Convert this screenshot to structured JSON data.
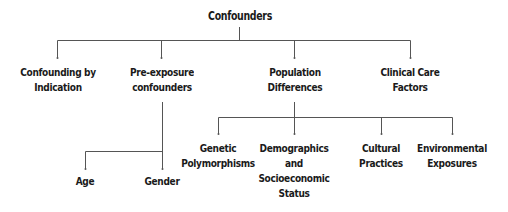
{
  "diagram": {
    "type": "tree",
    "root": {
      "label": "Confounders",
      "children": [
        {
          "label_lines": [
            "Confounding by",
            "Indication"
          ],
          "children": []
        },
        {
          "label_lines": [
            "Pre-exposure",
            "confounders"
          ],
          "children": [
            {
              "label_lines": [
                "Age"
              ]
            },
            {
              "label_lines": [
                "Gender"
              ]
            }
          ]
        },
        {
          "label_lines": [
            "Population",
            "Differences"
          ],
          "children": [
            {
              "label_lines": [
                "Genetic",
                "Polymorphisms"
              ]
            },
            {
              "label_lines": [
                "Demographics",
                "and",
                "Socioeconomic",
                "Status"
              ]
            },
            {
              "label_lines": [
                "Cultural",
                "Practices"
              ]
            },
            {
              "label_lines": [
                "Environmental",
                "Exposures"
              ]
            }
          ]
        },
        {
          "label_lines": [
            "Clinical Care",
            "Factors"
          ],
          "children": []
        }
      ]
    },
    "colors": {
      "text": "#1a1a1a",
      "line": "#555555",
      "background": "#ffffff"
    }
  }
}
